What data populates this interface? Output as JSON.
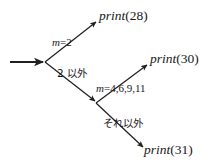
{
  "diagram": {
    "type": "decision-tree",
    "orientation": "left-to-right",
    "background_color": "#ffffff",
    "line_color": "#221f1f",
    "text_color": "#1a1718",
    "nodes": [
      {
        "id": "root",
        "kind": "branch-point",
        "x": 45,
        "y": 62
      },
      {
        "id": "node2",
        "kind": "branch-point",
        "x": 96,
        "y": 103
      }
    ],
    "entry_arrow": {
      "from_x": 10,
      "from_y": 62,
      "to_x": 45,
      "to_y": 62
    },
    "edges": [
      {
        "id": "edge-m2",
        "from": "root",
        "to": "leaf-28",
        "condition_label": "m=2"
      },
      {
        "id": "edge-not2",
        "from": "root",
        "to": "node2",
        "condition_label": "2 以外"
      },
      {
        "id": "edge-mset",
        "from": "node2",
        "to": "leaf-30",
        "condition_label": "m=4,6,9,11"
      },
      {
        "id": "edge-otherwise",
        "from": "node2",
        "to": "leaf-31",
        "condition_label": "それ以外"
      }
    ]
  },
  "labels": {
    "condition_m2_var": "m",
    "condition_m2_rest": "=2",
    "condition_not2": "2 以外",
    "condition_mset_var": "m",
    "condition_mset_rest": "=4,6,9,11",
    "condition_otherwise": "それ以外"
  },
  "leaves": [
    {
      "id": "leaf-28",
      "function": "print",
      "argument": "(28)"
    },
    {
      "id": "leaf-30",
      "function": "print",
      "argument": "(30)"
    },
    {
      "id": "leaf-31",
      "function": "print",
      "argument": "(31)"
    }
  ]
}
